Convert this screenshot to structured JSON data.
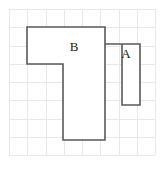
{
  "figure": {
    "background_color": "#ffffff",
    "grid": {
      "visible": true,
      "columns": 8,
      "rows": 8,
      "cell_size_px": 18.25,
      "origin_x_px": 9,
      "origin_y_px": 9,
      "line_color": "#e8e8e8",
      "line_width_px": 1
    },
    "shapes": [
      {
        "id": "shape-b",
        "label": "B",
        "type": "polygon",
        "description": "T-shaped / inverted-L polygon: wide bar across the top two rows with a vertical stem descending from its right portion",
        "stroke_color": "#595959",
        "fill_color": "#ffffff",
        "stroke_width_px": 1.6,
        "label_x_px": 74,
        "label_y_px": 48,
        "points_px": "27,27 105,27 105,140 63,140 63,64 27,64",
        "vertices_grid": [
          [
            1,
            1
          ],
          [
            5.26,
            1
          ],
          [
            5.26,
            7.18
          ],
          [
            2.96,
            7.18
          ],
          [
            2.96,
            3.01
          ],
          [
            1,
            3.01
          ]
        ]
      },
      {
        "id": "shape-a",
        "label": "A",
        "type": "polygon",
        "description": "Tall narrow rectangle to the right of shape B, overlapping its right edge",
        "stroke_color": "#595959",
        "fill_color": "#ffffff",
        "stroke_width_px": 1.6,
        "label_x_px": 126,
        "label_y_px": 55,
        "points_px": "105,44 140,44 140,105 122,105 122,44",
        "vertices_grid": [
          [
            5.26,
            1.92
          ],
          [
            7.18,
            1.92
          ],
          [
            7.18,
            5.26
          ],
          [
            6.19,
            5.26
          ],
          [
            6.19,
            1.92
          ]
        ]
      }
    ],
    "labels": [
      {
        "text": "B",
        "x_px": 74,
        "y_px": 48
      },
      {
        "text": "A",
        "x_px": 126,
        "y_px": 55
      }
    ]
  }
}
